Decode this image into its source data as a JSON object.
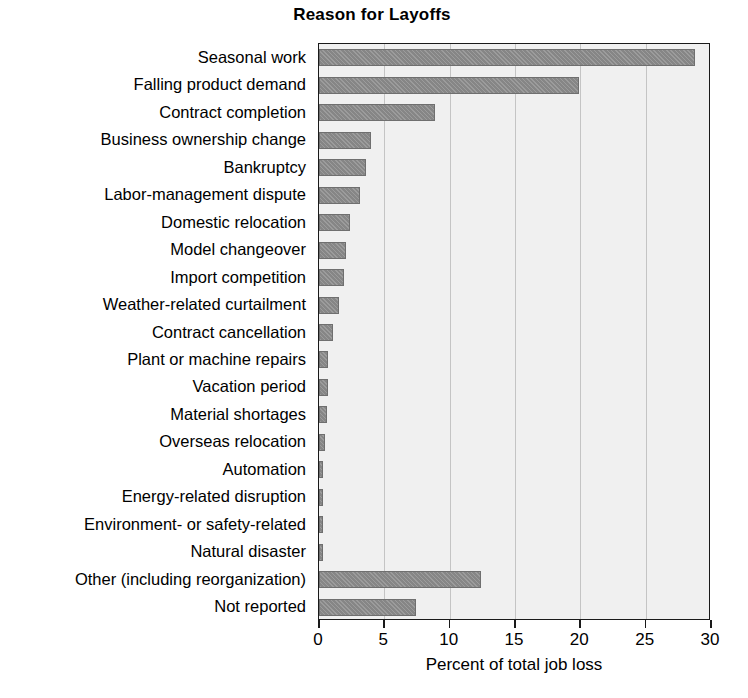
{
  "chart_data": {
    "type": "bar",
    "orientation": "horizontal",
    "title": "Reason for Layoffs",
    "xlabel": "Percent of total job loss",
    "ylabel": "",
    "xlim": [
      0,
      30
    ],
    "xticks": [
      0,
      5,
      10,
      15,
      20,
      25,
      30
    ],
    "xtick_labels": [
      "0",
      "5",
      "10",
      "15",
      "20",
      "25",
      "30"
    ],
    "grid": true,
    "grid_axis": "x",
    "legend": false,
    "categories": [
      "Seasonal work",
      "Falling product demand",
      "Contract completion",
      "Business ownership change",
      "Bankruptcy",
      "Labor-management dispute",
      "Domestic relocation",
      "Model changeover",
      "Import competition",
      "Weather-related curtailment",
      "Contract cancellation",
      "Plant or machine repairs",
      "Vacation period",
      "Material shortages",
      "Overseas relocation",
      "Automation",
      "Energy-related disruption",
      "Environment- or safety-related",
      "Natural disaster",
      "Other (including reorganization)",
      "Not reported"
    ],
    "values": [
      28.8,
      19.9,
      8.9,
      4.0,
      3.6,
      3.1,
      2.4,
      2.1,
      1.9,
      1.5,
      1.1,
      0.7,
      0.7,
      0.6,
      0.45,
      0.3,
      0.3,
      0.3,
      0.3,
      12.4,
      7.4
    ]
  },
  "style": {
    "bar_color": "#8d8d8d",
    "bar_edge_color": "#6f6f6f",
    "plot_background": "#f0f0f0",
    "grid_color": "#c4c4c4",
    "axis_color": "#1a1a1a",
    "text_color": "#000000",
    "page_background": "#ffffff"
  }
}
